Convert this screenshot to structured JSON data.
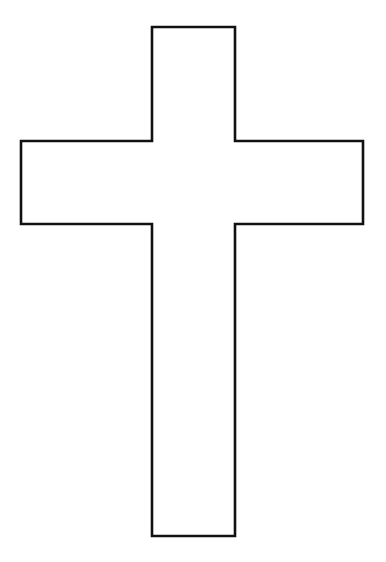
{
  "image": {
    "kind": "line-art-drawing",
    "subject": "latin-cross-outline",
    "title": "Cross Outline",
    "width": 386,
    "height": 562,
    "background_color": "#FFFFFF",
    "stroke_color": "#111111",
    "fill_color": "#FFFFFF",
    "stroke_width": 2.6,
    "text_content": ""
  },
  "shape": {
    "name": "cross-outline-path",
    "description": "Twelve-sided latin cross outline, unfilled, drawn as a single closed black contour on white.",
    "vertex_count": 12,
    "points": [
      [
        152,
        27
      ],
      [
        235,
        27
      ],
      [
        235,
        141
      ],
      [
        363,
        141
      ],
      [
        363,
        224
      ],
      [
        235,
        224
      ],
      [
        235,
        536
      ],
      [
        152,
        536
      ],
      [
        152,
        224
      ],
      [
        21,
        224
      ],
      [
        21,
        141
      ],
      [
        152,
        141
      ]
    ],
    "svg_path": "M152,27 L235,27 L235,141 L363,141 L363,224 L235,224 L235,536 L152,536 L152,224 L21,224 L21,141 L152,141 Z",
    "metrics": {
      "vertical_beam_left_x": 152,
      "vertical_beam_right_x": 235,
      "vertical_beam_top_y": 27,
      "vertical_beam_bottom_y": 536,
      "vertical_beam_width": 83,
      "vertical_beam_height": 509,
      "horizontal_arm_left_x": 21,
      "horizontal_arm_right_x": 363,
      "horizontal_arm_top_y": 141,
      "horizontal_arm_bottom_y": 224,
      "horizontal_arm_span": 342,
      "horizontal_arm_height": 83,
      "left_arm_length": 131,
      "right_arm_length": 128,
      "head_length": 114,
      "foot_length": 312
    }
  }
}
